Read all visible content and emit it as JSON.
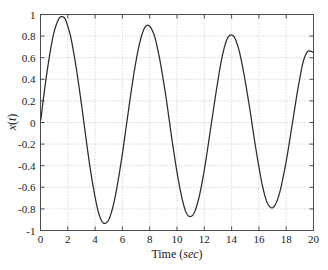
{
  "chart_data": {
    "type": "line",
    "title": "",
    "subtitle": "",
    "xlabel": "Time (sec)",
    "xlabel_plain": "Time (",
    "xlabel_italic": "sec",
    "xlabel_close": ")",
    "ylabel": "x(t)",
    "ylabel_plain": "x",
    "ylabel_paren_open": "(",
    "ylabel_italic": "t",
    "ylabel_paren_close": ")",
    "xlim": [
      0,
      20
    ],
    "ylim": [
      -1,
      1
    ],
    "xticks": [
      0,
      2,
      4,
      6,
      8,
      10,
      12,
      14,
      16,
      18,
      20
    ],
    "yticks": [
      -1,
      -0.8,
      -0.6,
      -0.4,
      -0.2,
      0,
      0.2,
      0.4,
      0.6,
      0.8,
      1
    ],
    "xtick_labels": [
      "0",
      "2",
      "4",
      "6",
      "8",
      "10",
      "12",
      "14",
      "16",
      "18",
      "20"
    ],
    "ytick_labels": [
      "-1",
      "-0.8",
      "-0.6",
      "-0.4",
      "-0.2",
      "0",
      "0.2",
      "0.4",
      "0.6",
      "0.8",
      "1"
    ],
    "grid": true,
    "grid_style": "dotted",
    "legend": null,
    "legend_position": "none",
    "line_color": "#2b2b2b",
    "grid_color": "#b0b0b0",
    "frame_color": "#4d4d4d",
    "background_color": "#ffffff",
    "series": [
      {
        "name": "x(t)",
        "description": "Decaying-amplitude sinusoid, period about 6.3 sec",
        "amplitude_start": 0.99,
        "amplitude_decay_per_sec": 0.0115,
        "period": 6.3,
        "phase": 0,
        "x": [
          0.0,
          0.2,
          0.4,
          0.6,
          0.8,
          1.0,
          1.2,
          1.4,
          1.6,
          1.8,
          2.0,
          2.2,
          2.4,
          2.6,
          2.8,
          3.0,
          3.2,
          3.4,
          3.6,
          3.8,
          4.0,
          4.2,
          4.4,
          4.6,
          4.8,
          5.0,
          5.2,
          5.4,
          5.6,
          5.8,
          6.0,
          6.2,
          6.4,
          6.6,
          6.8,
          7.0,
          7.2,
          7.4,
          7.6,
          7.8,
          8.0,
          8.2,
          8.4,
          8.6,
          8.8,
          9.0,
          9.2,
          9.4,
          9.6,
          9.8,
          10.0,
          10.2,
          10.4,
          10.6,
          10.8,
          11.0,
          11.2,
          11.4,
          11.6,
          11.8,
          12.0,
          12.2,
          12.4,
          12.6,
          12.8,
          13.0,
          13.2,
          13.4,
          13.6,
          13.8,
          14.0,
          14.2,
          14.4,
          14.6,
          14.8,
          15.0,
          15.2,
          15.4,
          15.6,
          15.8,
          16.0,
          16.2,
          16.4,
          16.6,
          16.8,
          17.0,
          17.2,
          17.4,
          17.6,
          17.8,
          18.0,
          18.2,
          18.4,
          18.6,
          18.8,
          19.0,
          19.2,
          19.4,
          19.6,
          19.8,
          20.0
        ],
        "y": [
          0.02,
          0.21,
          0.4,
          0.57,
          0.72,
          0.84,
          0.92,
          0.97,
          0.98,
          0.96,
          0.89,
          0.8,
          0.67,
          0.52,
          0.35,
          0.17,
          -0.02,
          -0.21,
          -0.39,
          -0.55,
          -0.69,
          -0.81,
          -0.89,
          -0.93,
          -0.93,
          -0.9,
          -0.83,
          -0.73,
          -0.6,
          -0.45,
          -0.29,
          -0.11,
          0.07,
          0.25,
          0.42,
          0.57,
          0.7,
          0.8,
          0.87,
          0.9,
          0.89,
          0.85,
          0.78,
          0.67,
          0.54,
          0.39,
          0.23,
          0.05,
          -0.13,
          -0.3,
          -0.46,
          -0.6,
          -0.72,
          -0.81,
          -0.86,
          -0.87,
          -0.85,
          -0.79,
          -0.7,
          -0.58,
          -0.44,
          -0.28,
          -0.11,
          0.06,
          0.23,
          0.39,
          0.54,
          0.66,
          0.75,
          0.8,
          0.81,
          0.79,
          0.73,
          0.64,
          0.52,
          0.38,
          0.23,
          0.07,
          -0.1,
          -0.26,
          -0.41,
          -0.55,
          -0.66,
          -0.74,
          -0.78,
          -0.79,
          -0.76,
          -0.7,
          -0.61,
          -0.49,
          -0.36,
          -0.21,
          -0.05,
          0.11,
          0.27,
          0.41,
          0.54,
          0.62,
          0.66,
          0.66,
          0.65
        ],
        "extrema": [
          {
            "label": "peak-1",
            "x": 1.65,
            "y": 0.98
          },
          {
            "label": "trough-1",
            "x": 4.65,
            "y": -0.93
          },
          {
            "label": "peak-2",
            "x": 7.95,
            "y": 0.89
          },
          {
            "label": "trough-2",
            "x": 10.9,
            "y": -0.86
          },
          {
            "label": "peak-3",
            "x": 14.15,
            "y": 0.8
          },
          {
            "label": "trough-3",
            "x": 17.3,
            "y": -0.78
          }
        ]
      }
    ]
  }
}
